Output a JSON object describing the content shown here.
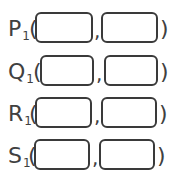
{
  "points": [
    {
      "letter": "P",
      "subscript": "1",
      "open": "(",
      "comma": ",",
      "close": ")",
      "x_value": "",
      "y_value": ""
    },
    {
      "letter": "Q",
      "subscript": "1",
      "open": "(",
      "comma": ",",
      "close": ")",
      "x_value": "",
      "y_value": ""
    },
    {
      "letter": "R",
      "subscript": "1",
      "open": "(",
      "comma": ",",
      "close": ")",
      "x_value": "",
      "y_value": ""
    },
    {
      "letter": "S",
      "subscript": "1",
      "open": "(",
      "comma": ",",
      "close": ")",
      "x_value": "",
      "y_value": ""
    }
  ]
}
